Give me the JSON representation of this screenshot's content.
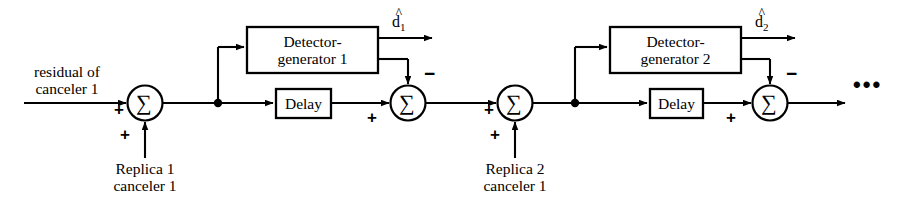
{
  "diagram": {
    "line_color": "#000000",
    "background": "#ffffff",
    "input": {
      "label_line1": "residual of",
      "label_line2": "canceler 1"
    },
    "stages": [
      {
        "index": 1,
        "detector_line1": "Detector-",
        "detector_line2": "generator 1",
        "delay_label": "Delay",
        "output_base": "d",
        "output_hat": "^",
        "output_subscript": "1",
        "replica_line1": "Replica 1",
        "replica_line2": "canceler 1",
        "sum_symbol": "∑",
        "sign_input": "+",
        "sign_replica": "+",
        "sign_delay": "+",
        "sign_detector": "−"
      },
      {
        "index": 2,
        "detector_line1": "Detector-",
        "detector_line2": "generator 2",
        "delay_label": "Delay",
        "output_base": "d",
        "output_hat": "^",
        "output_subscript": "2",
        "replica_line1": "Replica 2",
        "replica_line2": "canceler 1",
        "sum_symbol": "∑",
        "sign_input": "+",
        "sign_replica": "+",
        "sign_delay": "+",
        "sign_detector": "−"
      }
    ],
    "continuation": "•••"
  }
}
